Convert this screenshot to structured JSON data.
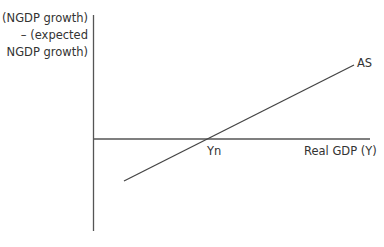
{
  "diagram": {
    "type": "economics-aggregate-supply",
    "y_axis_label": [
      "(NGDP growth)",
      "– (expected",
      "NGDP growth)"
    ],
    "x_axis_label": "Real GDP (Y)",
    "curve_label": "AS",
    "intercept_label": "Yn",
    "colors": {
      "line": "#444444",
      "axis": "#555555",
      "background": "#ffffff"
    }
  }
}
